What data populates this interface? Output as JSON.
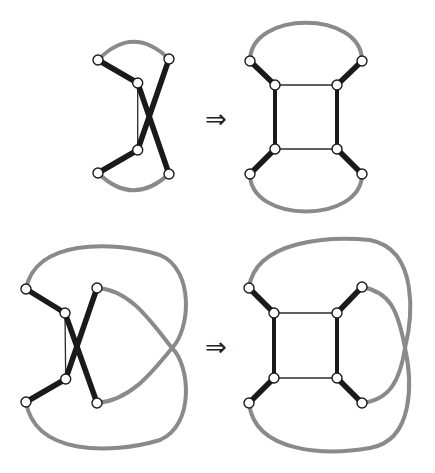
{
  "figure": {
    "transform_symbol": "⇒",
    "colors": {
      "thick_edge": "#1a1a1a",
      "thin_edge": "#2a2a2a",
      "gray_curve": "#8a8a8a",
      "node_fill": "#ffffff",
      "background": "#ffffff"
    },
    "panels": [
      {
        "id": "top-left",
        "label": "crossed graph with two gray arcs",
        "node_count": 6
      },
      {
        "id": "top-right",
        "label": "square graph with two gray arcs",
        "node_count": 8
      },
      {
        "id": "bottom-left",
        "label": "crossed graph with outer gray loops",
        "node_count": 6
      },
      {
        "id": "bottom-right",
        "label": "square graph with outer gray loops",
        "node_count": 8
      }
    ],
    "arrows": [
      {
        "from": "top-left",
        "to": "top-right",
        "symbol": "⇒"
      },
      {
        "from": "bottom-left",
        "to": "bottom-right",
        "symbol": "⇒"
      }
    ]
  }
}
